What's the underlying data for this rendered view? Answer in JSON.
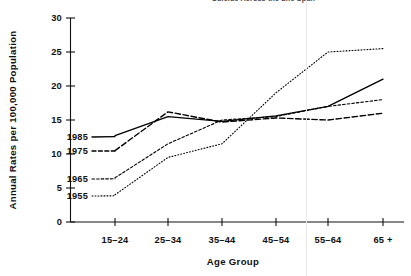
{
  "title": {
    "text": "Suicide Across the Life Span",
    "note": "clipped at top edge of image"
  },
  "axes": {
    "y_title": "Annual Rates per 100,000 Population",
    "x_title": "Age Group",
    "y_ticks": [
      "0",
      "5",
      "10",
      "15",
      "20",
      "25",
      "30"
    ],
    "x_ticks": [
      "15–24",
      "25–34",
      "35–44",
      "45–54",
      "55–64",
      "65 +"
    ]
  },
  "series_labels": {
    "s1985": "1985",
    "s1975": "1975",
    "s1965": "1965",
    "s1955": "1955"
  },
  "chart_data": {
    "type": "line",
    "title": "Suicide Across the Life Span",
    "xlabel": "Age Group",
    "ylabel": "Annual Rates per 100,000 Population",
    "categories": [
      "15-24",
      "25-34",
      "35-44",
      "45-54",
      "55-64",
      "65+"
    ],
    "ylim": [
      0,
      30
    ],
    "yticks": [
      0,
      5,
      10,
      15,
      20,
      25,
      30
    ],
    "grid": false,
    "legend": "inline-labels-left",
    "series": [
      {
        "name": "1985",
        "style": "solid",
        "color": "#000000",
        "values": [
          12.7,
          15.5,
          14.8,
          15.6,
          17.0,
          21.0
        ]
      },
      {
        "name": "1975",
        "style": "dashed",
        "color": "#000000",
        "values": [
          10.5,
          16.2,
          14.7,
          15.3,
          15.0,
          16.0
        ]
      },
      {
        "name": "1965",
        "style": "fine-dashed",
        "color": "#000000",
        "values": [
          6.5,
          11.5,
          15.0,
          15.5,
          17.0,
          18.0
        ]
      },
      {
        "name": "1955",
        "style": "dotted",
        "color": "#000000",
        "values": [
          4.0,
          9.5,
          11.5,
          19.0,
          25.0,
          25.5
        ]
      }
    ]
  }
}
